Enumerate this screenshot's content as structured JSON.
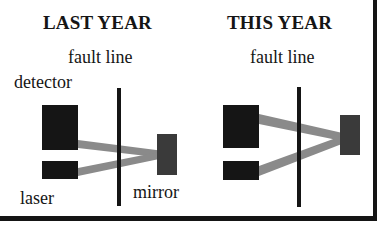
{
  "panels": [
    {
      "title": "LAST YEAR",
      "labels": {
        "fault_line": "fault line",
        "detector": "detector",
        "laser": "laser",
        "mirror": "mirror"
      }
    },
    {
      "title": "THIS YEAR",
      "labels": {
        "fault_line": "fault line"
      }
    }
  ],
  "colors": {
    "ink": "#151515",
    "beam": "#8a8a8a",
    "mirror": "#3a3a3a",
    "background": "#ffffff"
  }
}
